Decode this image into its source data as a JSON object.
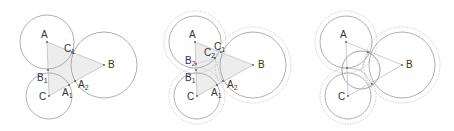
{
  "figure": {
    "panels": [
      {
        "id": "panel-1",
        "points": [
          {
            "name": "A",
            "sub": ""
          },
          {
            "name": "B",
            "sub": ""
          },
          {
            "name": "C",
            "sub": ""
          },
          {
            "name": "C",
            "sub": "1"
          },
          {
            "name": "B",
            "sub": "1"
          },
          {
            "name": "A",
            "sub": "1"
          },
          {
            "name": "A",
            "sub": "2"
          }
        ]
      },
      {
        "id": "panel-2",
        "points": [
          {
            "name": "A",
            "sub": ""
          },
          {
            "name": "B",
            "sub": ""
          },
          {
            "name": "C",
            "sub": ""
          },
          {
            "name": "C",
            "sub": "1"
          },
          {
            "name": "C",
            "sub": "2"
          },
          {
            "name": "B",
            "sub": "2"
          },
          {
            "name": "B",
            "sub": "1"
          },
          {
            "name": "A",
            "sub": "1"
          },
          {
            "name": "A",
            "sub": "2"
          }
        ]
      },
      {
        "id": "panel-3",
        "points": [
          {
            "name": "A",
            "sub": ""
          },
          {
            "name": "B",
            "sub": ""
          },
          {
            "name": "C",
            "sub": ""
          }
        ]
      }
    ]
  }
}
